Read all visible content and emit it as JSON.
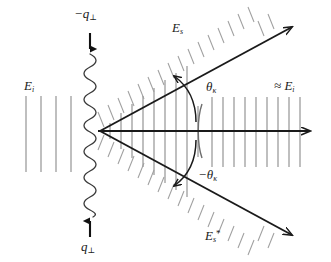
{
  "figure": {
    "type": "physics-schematic",
    "title": "",
    "background_color": "#ffffff",
    "width": 331,
    "height": 262
  },
  "colors": {
    "arrow_stroke": "#1a1a1a",
    "wavefront_stroke": "#808080",
    "hatch_stroke": "#999999",
    "sinusoid_stroke": "#333333",
    "label_text": "#1a1a1a"
  },
  "labels": {
    "incident_field": "E",
    "incident_field_sub": "i",
    "momentum_down": "−q",
    "momentum_down_sub": "⊥",
    "momentum_up": "q",
    "momentum_up_sub": "⊥",
    "scattered_field": "E",
    "scattered_field_sub": "s",
    "scattered_field_conj": "E",
    "scattered_field_conj_sub": "s",
    "scattered_field_conj_sup": "*",
    "angle_positive": "θ",
    "angle_positive_sub": "κ",
    "angle_negative": "−θ",
    "angle_negative_sub": "κ",
    "transmitted_approx": "≈ E",
    "transmitted_approx_sub": "i"
  },
  "geometry": {
    "vertex_x": 100,
    "vertex_y": 131,
    "axis_arrow_tip_x": 318,
    "upper_arrow_tip_x": 300,
    "upper_arrow_tip_y": 22,
    "lower_arrow_tip_x": 300,
    "lower_arrow_tip_y": 240,
    "sinusoid_x": 90,
    "sinusoid_top_y": 54,
    "sinusoid_bottom_y": 216,
    "sinusoid_periods": 9,
    "left_wavefront_count": 4,
    "right_wavefront_count": 10
  },
  "annotations": {
    "axis_label": "optical axis",
    "up_arrow_name": "momentum-up-arrow",
    "down_arrow_name": "momentum-down-arrow"
  }
}
